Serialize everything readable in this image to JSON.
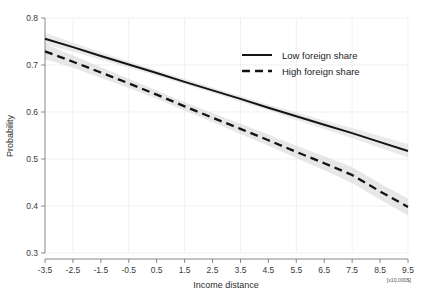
{
  "chart_data": {
    "type": "line",
    "title": "",
    "xlabel": "Income distance",
    "ylabel": "Probability",
    "xlim": [
      -3.5,
      9.5
    ],
    "ylim": [
      0.3,
      0.8
    ],
    "grid": true,
    "legend_position": "top-right",
    "x_unit_note": "[x10,000$]",
    "x_ticks": [
      "-3.5",
      "-2.5",
      "-1.5",
      "-0.5",
      "0.5",
      "1.5",
      "2.5",
      "3.5",
      "4.5",
      "5.5",
      "6.5",
      "7.5",
      "8.5",
      "9.5"
    ],
    "x_tick_values": [
      -3.5,
      -2.5,
      -1.5,
      -0.5,
      0.5,
      1.5,
      2.5,
      3.5,
      4.5,
      5.5,
      6.5,
      7.5,
      8.5,
      9.5
    ],
    "y_ticks": [
      "0.3",
      "0.4",
      "0.5",
      "0.6",
      "0.7",
      "0.8"
    ],
    "y_tick_values": [
      0.3,
      0.4,
      0.5,
      0.6,
      0.7,
      0.8
    ],
    "x": [
      -3.5,
      -2.5,
      -1.5,
      -0.5,
      0.5,
      1.5,
      2.5,
      3.5,
      4.5,
      5.5,
      6.5,
      7.5,
      8.5,
      9.5
    ],
    "series": [
      {
        "name": "Low foreign share",
        "style": "solid",
        "color": "#141414",
        "values": [
          0.756,
          0.738,
          0.719,
          0.701,
          0.683,
          0.664,
          0.646,
          0.628,
          0.609,
          0.591,
          0.573,
          0.555,
          0.536,
          0.517
        ],
        "ci_lower": [
          0.744,
          0.728,
          0.711,
          0.694,
          0.677,
          0.659,
          0.641,
          0.622,
          0.603,
          0.583,
          0.564,
          0.544,
          0.524,
          0.503
        ],
        "ci_upper": [
          0.768,
          0.748,
          0.727,
          0.708,
          0.689,
          0.67,
          0.652,
          0.634,
          0.616,
          0.599,
          0.582,
          0.566,
          0.549,
          0.532
        ]
      },
      {
        "name": "High foreign share",
        "style": "dashed",
        "color": "#141414",
        "values": [
          0.729,
          0.707,
          0.684,
          0.661,
          0.637,
          0.612,
          0.588,
          0.564,
          0.54,
          0.515,
          0.491,
          0.466,
          0.431,
          0.398
        ],
        "ci_lower": [
          0.713,
          0.694,
          0.673,
          0.651,
          0.628,
          0.603,
          0.578,
          0.553,
          0.528,
          0.502,
          0.476,
          0.449,
          0.414,
          0.38
        ],
        "ci_upper": [
          0.745,
          0.72,
          0.695,
          0.671,
          0.646,
          0.621,
          0.598,
          0.575,
          0.552,
          0.528,
          0.506,
          0.483,
          0.448,
          0.416
        ]
      }
    ]
  },
  "legend": {
    "items": [
      {
        "label": "Low foreign share",
        "style": "solid"
      },
      {
        "label": "High foreign share",
        "style": "dashed"
      }
    ]
  },
  "axes": {
    "x_title": "Income distance",
    "y_title": "Probability",
    "x_unit_note": "[x10,000$]"
  }
}
